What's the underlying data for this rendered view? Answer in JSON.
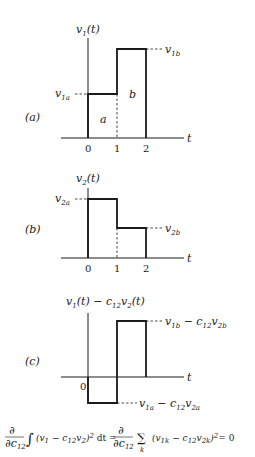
{
  "figure": {
    "panel_a": {
      "tag": "(a)",
      "ylabel": "v",
      "ylabel_sub": "1",
      "ylabel_arg": "(t)",
      "xlabel": "t",
      "ticks": [
        "0",
        "1",
        "2"
      ],
      "level_a_label": "v",
      "level_a_sub": "1a",
      "level_b_label": "v",
      "level_b_sub": "1b",
      "region_a": "a",
      "region_b": "b"
    },
    "panel_b": {
      "tag": "(b)",
      "ylabel": "v",
      "ylabel_sub": "2",
      "ylabel_arg": "(t)",
      "xlabel": "t",
      "ticks": [
        "0",
        "1",
        "2"
      ],
      "level_a_label": "v",
      "level_a_sub": "2a",
      "level_b_label": "v",
      "level_b_sub": "2b"
    },
    "panel_c": {
      "tag": "(c)",
      "ylabel_1": "v",
      "ylabel_1_sub": "1",
      "ylabel_mid": "(t) − c",
      "ylabel_c_sub": "12",
      "ylabel_2": "v",
      "ylabel_2_sub": "2",
      "ylabel_arg": "(t)",
      "xlabel": "t",
      "origin": "0",
      "top_label_v": "v",
      "top_label_v_sub": "1b",
      "top_label_mid": " − c",
      "top_label_c_sub": "12",
      "top_label_v2": "v",
      "top_label_v2_sub": "2b",
      "bot_label_v": "v",
      "bot_label_v_sub": "1a",
      "bot_label_mid": " − c",
      "bot_label_c_sub": "12",
      "bot_label_v2": "v",
      "bot_label_v2_sub": "2a"
    },
    "equation": {
      "partial": "∂",
      "dc": "∂c",
      "dc_sub": "12",
      "integral": "∫",
      "integrand": "(v",
      "i_sub1": "1",
      "i_minus": " − c",
      "i_sub12": "12",
      "i_v2": "v",
      "i_sub2": "2",
      "i_close": ")",
      "i_sq": "2",
      "dt": " dt =",
      "sum": "∑",
      "sum_idx": "k",
      "s_open": "(v",
      "s_sub1k": "1k",
      "s_minus": " − c",
      "s_sub12": "12",
      "s_v2": "v",
      "s_sub2k": "2k",
      "s_close": ")",
      "s_sq": "2",
      "equals_zero": "= 0"
    }
  }
}
